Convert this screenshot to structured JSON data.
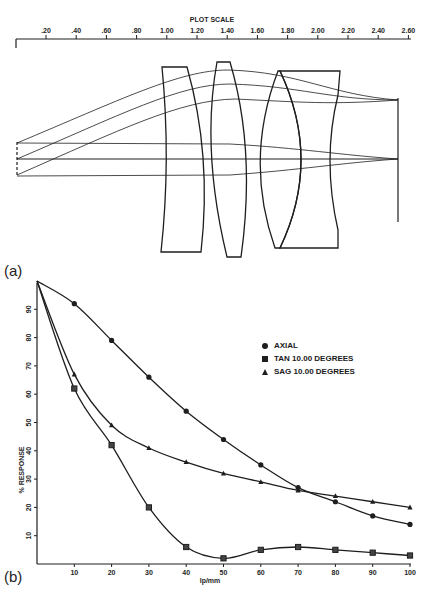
{
  "figure_a": {
    "panel_label": "(a)",
    "scale_title": "PLOT SCALE",
    "scale_ticks": [
      ".20",
      ".40",
      ".60",
      ".80",
      "1.00",
      "1.20",
      "1.40",
      "1.60",
      "1.80",
      "2.00",
      "2.20",
      "2.40",
      "2.60"
    ]
  },
  "figure_b": {
    "panel_label": "(b)",
    "legend": [
      {
        "marker": "circle",
        "label": "AXIAL"
      },
      {
        "marker": "square",
        "label": "TAN 10.00 DEGREES"
      },
      {
        "marker": "triangle",
        "label": "SAG 10.00 DEGREES"
      }
    ]
  },
  "chart_data": [
    {
      "type": "diagram",
      "title": "PLOT SCALE",
      "description": "Optical lens layout: four lens elements with ray traces converging to image plane",
      "scale_ticks": [
        0.2,
        0.4,
        0.6,
        0.8,
        1.0,
        1.2,
        1.4,
        1.6,
        1.8,
        2.0,
        2.2,
        2.4,
        2.6
      ]
    },
    {
      "type": "line",
      "title": "",
      "xlabel": "lp/mm",
      "ylabel": "% RESPONSE",
      "x": [
        0,
        10,
        20,
        30,
        40,
        50,
        60,
        70,
        80,
        90,
        100
      ],
      "xticks": [
        10,
        20,
        30,
        40,
        50,
        60,
        70,
        80,
        90,
        100
      ],
      "yticks": [
        10,
        20,
        30,
        40,
        50,
        60,
        70,
        80,
        90
      ],
      "xlim": [
        0,
        100
      ],
      "ylim": [
        0,
        100
      ],
      "grid": false,
      "legend_position": "upper right",
      "series": [
        {
          "name": "AXIAL",
          "marker": "circle",
          "values": [
            100,
            92,
            79,
            66,
            54,
            44,
            35,
            27,
            22,
            17,
            14
          ]
        },
        {
          "name": "TAN 10.00 DEGREES",
          "marker": "square",
          "values": [
            100,
            62,
            42,
            20,
            6,
            2,
            5,
            6,
            5,
            4,
            3
          ]
        },
        {
          "name": "SAG 10.00 DEGREES",
          "marker": "triangle",
          "values": [
            100,
            67,
            49,
            41,
            36,
            32,
            29,
            26,
            24,
            22,
            20
          ]
        }
      ]
    }
  ]
}
